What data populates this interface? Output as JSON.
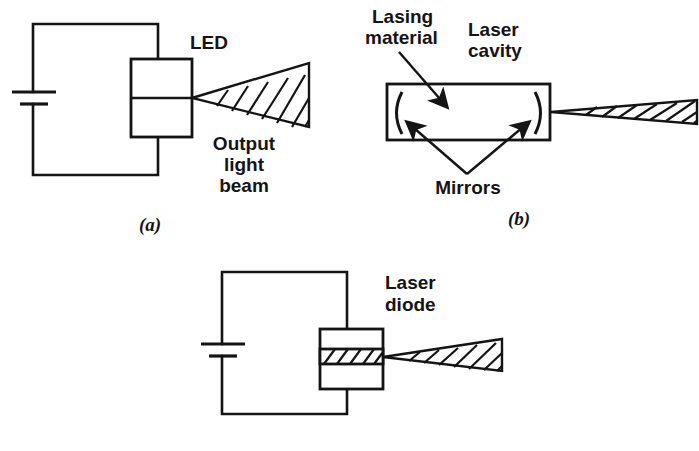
{
  "figure": {
    "background_color": "#ffffff",
    "ink_color": "#141414"
  },
  "panels": [
    {
      "id": "a",
      "caption": "(a)",
      "caption_pos": {
        "x": 150,
        "y": 231
      },
      "labels": [
        {
          "name": "led-label",
          "text": "LED",
          "x": 190,
          "y": 49
        },
        {
          "name": "output-light-beam-label-line1",
          "text": "Output",
          "x": 244,
          "y": 150
        },
        {
          "name": "output-light-beam-label-line2",
          "text": "light",
          "x": 244,
          "y": 171
        },
        {
          "name": "output-light-beam-label-line3",
          "text": "beam",
          "x": 244,
          "y": 192
        }
      ],
      "circuit": {
        "loop": {
          "x1": 33,
          "y1": 24,
          "x2": 158,
          "y2": 175
        },
        "battery": {
          "long_plate": {
            "x1": 12,
            "y1": 92,
            "x2": 56,
            "y2": 92
          },
          "short_plate": {
            "x1": 20,
            "y1": 104,
            "x2": 48,
            "y2": 104
          }
        },
        "device_box": {
          "x": 131,
          "y": 59,
          "w": 61,
          "h": 78
        },
        "device_divider_y": 98
      },
      "beam": {
        "type": "wide-cone",
        "apex": {
          "x": 192,
          "y": 98
        },
        "top_end": {
          "x": 309,
          "y": 63
        },
        "bottom_end": {
          "x": 309,
          "y": 127
        },
        "hatch_count": 7
      }
    },
    {
      "id": "b",
      "caption": "(b)",
      "caption_pos": {
        "x": 519,
        "y": 225
      },
      "labels": [
        {
          "name": "lasing-material-label-line1",
          "text": "Lasing",
          "x": 372,
          "y": 23
        },
        {
          "name": "lasing-material-label-line2",
          "text": "material",
          "x": 365,
          "y": 44
        },
        {
          "name": "laser-cavity-label-line1",
          "text": "Laser",
          "x": 468,
          "y": 36
        },
        {
          "name": "laser-cavity-label-line2",
          "text": "cavity",
          "x": 468,
          "y": 57
        },
        {
          "name": "mirrors-label",
          "text": "Mirrors",
          "x": 438,
          "y": 194
        }
      ],
      "cavity": {
        "x": 387,
        "y": 84,
        "w": 163,
        "h": 56
      },
      "mirrors": [
        {
          "name": "left-mirror",
          "cx": 399,
          "top_y": 92,
          "bottom_y": 134,
          "bulge": -8
        },
        {
          "name": "right-mirror",
          "cx": 538,
          "top_y": 92,
          "bottom_y": 134,
          "bulge": 8
        }
      ],
      "beam": {
        "type": "narrow-cone",
        "apex": {
          "x": 551,
          "y": 112
        },
        "top_end": {
          "x": 697,
          "y": 100
        },
        "bottom_end": {
          "x": 697,
          "y": 124
        },
        "hatch_count": 8
      }
    },
    {
      "id": "c",
      "caption": "",
      "labels": [
        {
          "name": "laser-diode-label-line1",
          "text": "Laser",
          "x": 385,
          "y": 289
        },
        {
          "name": "laser-diode-label-line2",
          "text": "diode",
          "x": 385,
          "y": 311
        }
      ],
      "circuit": {
        "loop": {
          "x1": 222,
          "y1": 272,
          "x2": 347,
          "y2": 414
        },
        "battery": {
          "long_plate": {
            "x1": 201,
            "y1": 344,
            "x2": 245,
            "y2": 344
          },
          "short_plate": {
            "x1": 209,
            "y1": 356,
            "x2": 237,
            "y2": 356
          }
        },
        "device_box": {
          "x": 320,
          "y": 329,
          "w": 63,
          "h": 60
        },
        "active_layer": {
          "y": 349,
          "h": 15,
          "hatch_count": 5
        }
      },
      "beam": {
        "type": "wide-cone",
        "apex": {
          "x": 383,
          "y": 357
        },
        "top_end": {
          "x": 502,
          "y": 339
        },
        "bottom_end": {
          "x": 502,
          "y": 371
        },
        "hatch_count": 7
      }
    }
  ]
}
